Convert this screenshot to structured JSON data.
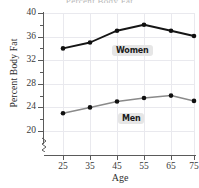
{
  "chart_data": {
    "type": "line",
    "title": "Percent Body Fat",
    "xlabel": "Age",
    "ylabel": "Percent Body Fat",
    "x": [
      25,
      35,
      45,
      55,
      65,
      75
    ],
    "xtick_labels": [
      "25",
      "35",
      "45",
      "55",
      "65",
      "75"
    ],
    "ytick_labels": [
      "20",
      "24",
      "28",
      "32",
      "36",
      "40"
    ],
    "ytick_values": [
      20,
      24,
      28,
      32,
      36,
      40
    ],
    "yminor_values": [
      22,
      26,
      30,
      34,
      38
    ],
    "ylim": [
      18,
      40
    ],
    "xlim": [
      20,
      80
    ],
    "grid": true,
    "legend": "inline-labels",
    "axis_break": true,
    "series": [
      {
        "name": "Women",
        "label": "Women",
        "color": "#151515",
        "values": [
          34,
          35,
          37,
          38,
          37,
          36.1
        ]
      },
      {
        "name": "Men",
        "label": "Men",
        "color": "#8a8a8a",
        "values": [
          23,
          24,
          25,
          25.6,
          26,
          25.1
        ]
      }
    ]
  },
  "axes": {
    "y_title": "Percent Body Fat",
    "x_title": "Age"
  },
  "colors": {
    "women_line": "#151515",
    "men_line": "#8a8a8a",
    "marker": "#101010",
    "grid": "#e9e9ee",
    "axis": "#5a5a5a",
    "tag_background": "#e6e6e6"
  }
}
